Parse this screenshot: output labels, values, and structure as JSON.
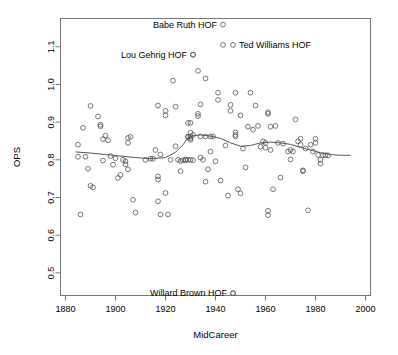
{
  "chart_data": {
    "type": "scatter",
    "title": "",
    "xlabel": "MidCareer",
    "ylabel": "OPS",
    "xlim": [
      1878,
      2002
    ],
    "ylim": [
      0.44,
      1.175
    ],
    "grid": false,
    "legend": false,
    "xticks": [
      1880,
      1900,
      1920,
      1940,
      1960,
      1980,
      2000
    ],
    "xtick_labels": [
      "1880",
      "1900",
      "1920",
      "1940",
      "1960",
      "1980",
      "2000"
    ],
    "yticks": [
      0.5,
      0.6,
      0.7,
      0.8,
      0.9,
      1.0,
      1.1
    ],
    "ytick_labels": [
      "0.5",
      "0.6",
      "0.7",
      "0.8",
      "0.9",
      "1.0",
      "1.1"
    ],
    "point_marker": "open-circle",
    "point_color": "#555555",
    "smoother_color": "#555555",
    "smoother_label": "loess trend line",
    "points": [
      [
        1885,
        0.84
      ],
      [
        1885,
        0.808
      ],
      [
        1886,
        0.655
      ],
      [
        1887,
        0.885
      ],
      [
        1888,
        0.808
      ],
      [
        1889,
        0.776
      ],
      [
        1890,
        0.943
      ],
      [
        1890,
        0.731
      ],
      [
        1891,
        0.727
      ],
      [
        1893,
        0.915
      ],
      [
        1894,
        0.893
      ],
      [
        1894,
        0.889
      ],
      [
        1895,
        0.855
      ],
      [
        1895,
        0.798
      ],
      [
        1896,
        0.864
      ],
      [
        1897,
        0.852
      ],
      [
        1898,
        0.81
      ],
      [
        1899,
        0.787
      ],
      [
        1900,
        0.804
      ],
      [
        1901,
        0.752
      ],
      [
        1902,
        0.76
      ],
      [
        1903,
        0.8
      ],
      [
        1904,
        0.796
      ],
      [
        1904,
        0.788
      ],
      [
        1905,
        0.858
      ],
      [
        1905,
        0.845
      ],
      [
        1905,
        0.775
      ],
      [
        1906,
        0.861
      ],
      [
        1907,
        0.694
      ],
      [
        1908,
        0.66
      ],
      [
        1912,
        0.8
      ],
      [
        1914,
        0.803
      ],
      [
        1915,
        0.803
      ],
      [
        1916,
        0.826
      ],
      [
        1917,
        0.944
      ],
      [
        1917,
        0.756
      ],
      [
        1917,
        0.748
      ],
      [
        1917,
        0.69
      ],
      [
        1918,
        0.814
      ],
      [
        1918,
        0.655
      ],
      [
        1920,
        0.93
      ],
      [
        1920,
        0.918
      ],
      [
        1920,
        0.712
      ],
      [
        1921,
        0.655
      ],
      [
        1922,
        0.8
      ],
      [
        1923,
        1.01
      ],
      [
        1924,
        0.941
      ],
      [
        1924,
        0.836
      ],
      [
        1925,
        0.8
      ],
      [
        1926,
        0.797
      ],
      [
        1926,
        0.77
      ],
      [
        1927,
        0.799
      ],
      [
        1928,
        0.801
      ],
      [
        1928,
        0.799
      ],
      [
        1929,
        0.898
      ],
      [
        1929,
        0.862
      ],
      [
        1929,
        0.86
      ],
      [
        1929,
        0.8
      ],
      [
        1930,
        0.898
      ],
      [
        1930,
        0.872
      ],
      [
        1930,
        0.862
      ],
      [
        1930,
        0.857
      ],
      [
        1930,
        0.853
      ],
      [
        1930,
        0.8
      ],
      [
        1931,
        1.079
      ],
      [
        1931,
        0.866
      ],
      [
        1931,
        0.799
      ],
      [
        1933,
        1.036
      ],
      [
        1933,
        0.922
      ],
      [
        1933,
        0.916
      ],
      [
        1934,
        0.947
      ],
      [
        1934,
        0.862
      ],
      [
        1934,
        0.806
      ],
      [
        1935,
        0.8
      ],
      [
        1936,
        1.016
      ],
      [
        1936,
        0.862
      ],
      [
        1936,
        0.742
      ],
      [
        1937,
        0.775
      ],
      [
        1938,
        0.862
      ],
      [
        1938,
        0.822
      ],
      [
        1939,
        0.862
      ],
      [
        1940,
        0.796
      ],
      [
        1941,
        0.978
      ],
      [
        1941,
        0.959
      ],
      [
        1942,
        0.745
      ],
      [
        1943,
        1.105
      ],
      [
        1944,
        0.838
      ],
      [
        1945,
        0.705
      ],
      [
        1946,
        0.946
      ],
      [
        1946,
        0.93
      ],
      [
        1947,
        0.446
      ],
      [
        1948,
        0.978
      ],
      [
        1948,
        0.873
      ],
      [
        1948,
        0.866
      ],
      [
        1948,
        0.862
      ],
      [
        1949,
        0.722
      ],
      [
        1950,
        0.918
      ],
      [
        1950,
        0.711
      ],
      [
        1951,
        0.83
      ],
      [
        1952,
        0.78
      ],
      [
        1953,
        0.888
      ],
      [
        1954,
        0.978
      ],
      [
        1955,
        0.88
      ],
      [
        1956,
        0.944
      ],
      [
        1957,
        0.89
      ],
      [
        1958,
        0.835
      ],
      [
        1959,
        0.849
      ],
      [
        1960,
        0.845
      ],
      [
        1960,
        0.832
      ],
      [
        1961,
        0.926
      ],
      [
        1961,
        0.922
      ],
      [
        1961,
        0.665
      ],
      [
        1961,
        0.653
      ],
      [
        1962,
        0.888
      ],
      [
        1962,
        0.826
      ],
      [
        1963,
        0.722
      ],
      [
        1964,
        0.89
      ],
      [
        1965,
        0.845
      ],
      [
        1966,
        0.753
      ],
      [
        1967,
        0.843
      ],
      [
        1969,
        0.822
      ],
      [
        1970,
        0.826
      ],
      [
        1970,
        0.801
      ],
      [
        1971,
        0.822
      ],
      [
        1972,
        0.907
      ],
      [
        1973,
        0.849
      ],
      [
        1974,
        0.856
      ],
      [
        1974,
        0.84
      ],
      [
        1975,
        0.772
      ],
      [
        1975,
        0.77
      ],
      [
        1976,
        0.83
      ],
      [
        1977,
        0.666
      ],
      [
        1978,
        0.84
      ],
      [
        1979,
        0.822
      ],
      [
        1980,
        0.856
      ],
      [
        1980,
        0.845
      ],
      [
        1981,
        0.813
      ],
      [
        1982,
        0.8
      ],
      [
        1982,
        0.79
      ],
      [
        1983,
        0.812
      ],
      [
        1984,
        0.812
      ],
      [
        1985,
        0.812
      ]
    ],
    "smoother": [
      [
        1884,
        0.821
      ],
      [
        1890,
        0.818
      ],
      [
        1896,
        0.814
      ],
      [
        1902,
        0.81
      ],
      [
        1908,
        0.806
      ],
      [
        1914,
        0.803
      ],
      [
        1920,
        0.806
      ],
      [
        1924,
        0.82
      ],
      [
        1927,
        0.84
      ],
      [
        1929,
        0.858
      ],
      [
        1931,
        0.864
      ],
      [
        1934,
        0.866
      ],
      [
        1938,
        0.863
      ],
      [
        1942,
        0.857
      ],
      [
        1946,
        0.845
      ],
      [
        1950,
        0.836
      ],
      [
        1954,
        0.838
      ],
      [
        1958,
        0.845
      ],
      [
        1962,
        0.847
      ],
      [
        1966,
        0.845
      ],
      [
        1970,
        0.841
      ],
      [
        1974,
        0.833
      ],
      [
        1978,
        0.826
      ],
      [
        1982,
        0.819
      ],
      [
        1986,
        0.814
      ],
      [
        1990,
        0.812
      ],
      [
        1994,
        0.812
      ]
    ],
    "annotations": [
      {
        "name": "babe-ruth",
        "text": "Babe Ruth HOF",
        "x": 1943,
        "y": 1.159,
        "marker_side": "right"
      },
      {
        "name": "ted-williams",
        "text": "Ted Williams HOF",
        "x": 1947,
        "y": 1.105,
        "marker_side": "left"
      },
      {
        "name": "lou-gehrig",
        "text": "Lou Gehrig HOF",
        "x": 1931,
        "y": 1.079,
        "marker_side": "right"
      },
      {
        "name": "willard-brown",
        "text": "Willard Brown HOF",
        "x": 1947,
        "y": 0.446,
        "marker_side": "right"
      }
    ]
  }
}
